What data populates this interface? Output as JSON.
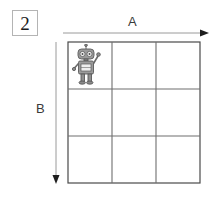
{
  "figure": {
    "number": "2",
    "badge_border_color": "#b4b4b4"
  },
  "axes": {
    "horizontal": {
      "label": "A",
      "direction": "right",
      "line_color": "#9a9a9a",
      "x_start": 63,
      "x_end": 208,
      "y": 33
    },
    "vertical": {
      "label": "B",
      "direction": "down",
      "line_color": "#9a9a9a",
      "x": 56,
      "y_start": 42,
      "y_end": 182
    }
  },
  "grid": {
    "columns": 3,
    "rows": 3,
    "line_color": "#6e6e6e",
    "border_color": "#4a4a4a",
    "left": 68,
    "top": 42,
    "width": 132,
    "height": 141,
    "cells": [
      [
        {
          "row": 0,
          "col": 0,
          "occupant": "robot"
        },
        {
          "row": 0,
          "col": 1,
          "occupant": null
        },
        {
          "row": 0,
          "col": 2,
          "occupant": null
        }
      ],
      [
        {
          "row": 1,
          "col": 0,
          "occupant": null
        },
        {
          "row": 1,
          "col": 1,
          "occupant": null
        },
        {
          "row": 1,
          "col": 2,
          "occupant": null
        }
      ],
      [
        {
          "row": 2,
          "col": 0,
          "occupant": null
        },
        {
          "row": 2,
          "col": 1,
          "occupant": null
        },
        {
          "row": 2,
          "col": 2,
          "occupant": null
        }
      ]
    ]
  },
  "robot": {
    "name": "robot-sprite",
    "cell_row": 0,
    "cell_col": 0,
    "pose": "right-arm-raised-waving",
    "body_color": "#8d8d8d",
    "outline_color": "#4f4f4f",
    "detail_color": "#e8e8e8"
  }
}
